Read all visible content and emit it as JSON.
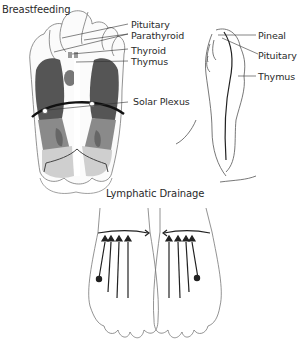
{
  "sections": {
    "breastfeeding": {
      "title": "Breastfeeding",
      "labels": [
        "Pituitary",
        "Parathyroid",
        "Thyroid",
        "Thymus",
        "Solar Plexus"
      ]
    },
    "side_foot": {
      "labels": [
        "Pineal",
        "Pituitary",
        "Thymus"
      ]
    },
    "lymphatic": {
      "title": "Lymphatic Drainage"
    }
  },
  "colors": {
    "line": "#3a3a3a",
    "dark_organ": "#555555",
    "mid_organ": "#8a8a8a",
    "light_organ": "#c8c8c8",
    "pale_organ": "#e2e2e2"
  }
}
